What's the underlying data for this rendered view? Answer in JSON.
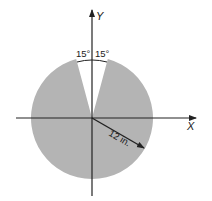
{
  "diagram": {
    "type": "circular sector (disk with wedge removed)",
    "axes": {
      "x_label": "X",
      "y_label": "Y"
    },
    "angles": {
      "left_label": "15°",
      "right_label": "15°",
      "left_deg": 15,
      "right_deg": 15
    },
    "radius": {
      "label": "12 in.",
      "value": 12,
      "unit": "in."
    },
    "colors": {
      "fill": "#b4b4b4",
      "axis": "#222222",
      "background": "#ffffff"
    }
  }
}
